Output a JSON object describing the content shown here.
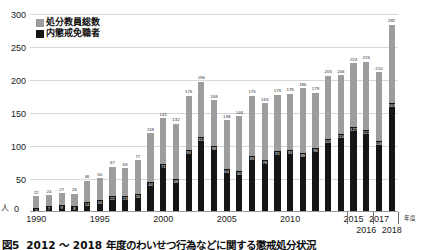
{
  "chart_data": {
    "type": "bar",
    "subtype": "stacked-overlay",
    "title": "",
    "xlabel": "年度",
    "ylabel": "人",
    "ylim": [
      0,
      300
    ],
    "yticks": [
      0,
      50,
      100,
      150,
      200,
      250,
      300
    ],
    "grid": true,
    "legend_position": "top-left",
    "series": [
      {
        "name": "処分教員総数",
        "color": "#9d9d9d",
        "values": [
          22,
          24,
          27,
          26,
          46,
          50,
          67,
          65,
          77,
          118,
          141,
          132,
          175,
          196,
          168,
          138,
          144,
          175,
          163,
          176,
          178,
          186,
          179,
          205,
          206,
          224,
          226,
          210,
          282
        ]
      },
      {
        "name": "内懲戒免職者",
        "color": "#151515",
        "values": [
          5,
          7,
          9,
          8,
          14,
          16,
          22,
          23,
          26,
          44,
          71,
          48,
          93,
          112,
          98,
          64,
          60,
          83,
          78,
          91,
          93,
          88,
          96,
          109,
          116,
          127,
          122,
          106,
          163
        ]
      }
    ],
    "categories": [
      "1990",
      "1991",
      "1992",
      "1993",
      "1994",
      "1995",
      "1996",
      "1997",
      "1998",
      "1999",
      "2000",
      "2001",
      "2002",
      "2003",
      "2004",
      "2005",
      "2006",
      "2007",
      "2008",
      "2009",
      "2010",
      "2011",
      "2012",
      "2013",
      "2014",
      "2015",
      "2016",
      "2017",
      "2018"
    ],
    "xtick_labels": [
      {
        "label": "1990",
        "index": 0
      },
      {
        "label": "1995",
        "index": 5
      },
      {
        "label": "2000",
        "index": 10
      },
      {
        "label": "2005",
        "index": 15
      },
      {
        "label": "2010",
        "index": 20
      },
      {
        "label": "2015",
        "index": 25
      },
      {
        "label": "2016",
        "index": 26
      },
      {
        "label": "2017",
        "index": 27
      },
      {
        "label": "2018",
        "index": 28
      }
    ]
  },
  "axis": {
    "y_unit": "人",
    "y_zero": "0",
    "x_unit": "年度",
    "y_labels": [
      "300",
      "250",
      "200",
      "150",
      "100",
      "50"
    ]
  },
  "legend": {
    "items": [
      {
        "label": "処分教員総数",
        "color": "#9d9d9d"
      },
      {
        "label": "内懲戒免職者",
        "color": "#151515"
      }
    ]
  },
  "caption": {
    "fig_number": "図5",
    "text": "2012 ～ 2018 年度のわいせつ行為などに関する懲戒処分状況"
  }
}
